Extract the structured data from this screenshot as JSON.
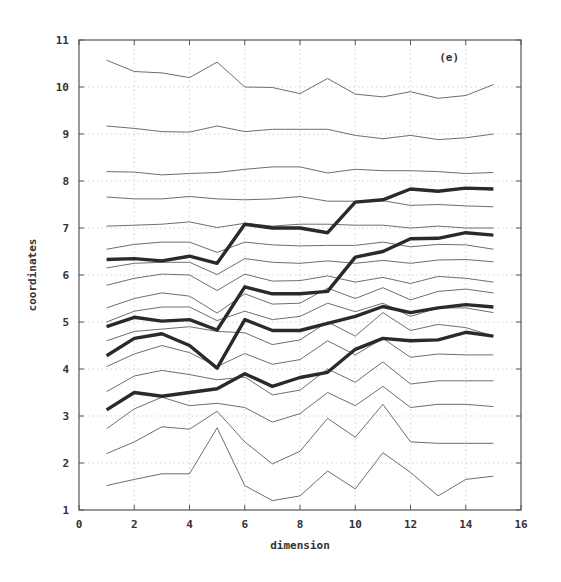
{
  "chart_data": {
    "type": "line",
    "title": "",
    "panel_label": "(e)",
    "xlabel": "dimension",
    "ylabel": "coordinates",
    "xlim": [
      0,
      16
    ],
    "ylim": [
      1,
      11
    ],
    "x_ticks": [
      0,
      2,
      4,
      6,
      8,
      10,
      12,
      14,
      16
    ],
    "y_ticks": [
      1,
      2,
      3,
      4,
      5,
      6,
      7,
      8,
      9,
      10,
      11
    ],
    "grid": true,
    "legend": null,
    "x": [
      1,
      2,
      3,
      4,
      5,
      6,
      7,
      8,
      9,
      10,
      11,
      12,
      13,
      14,
      15
    ],
    "series": [
      {
        "name": "thin-1",
        "style": "thin",
        "values": [
          10.57,
          10.33,
          10.3,
          10.2,
          10.53,
          10.0,
          9.99,
          9.86,
          10.18,
          9.85,
          9.79,
          9.9,
          9.76,
          9.82,
          10.05
        ]
      },
      {
        "name": "thin-2",
        "style": "thin",
        "values": [
          9.17,
          9.12,
          9.05,
          9.04,
          9.17,
          9.05,
          9.1,
          9.1,
          9.1,
          8.97,
          8.9,
          8.97,
          8.88,
          8.92,
          9.0
        ]
      },
      {
        "name": "thin-3",
        "style": "thin",
        "values": [
          8.2,
          8.19,
          8.13,
          8.16,
          8.18,
          8.25,
          8.3,
          8.3,
          8.17,
          8.25,
          8.22,
          8.22,
          8.2,
          8.16,
          8.18
        ]
      },
      {
        "name": "thin-4",
        "style": "thin",
        "values": [
          7.66,
          7.62,
          7.62,
          7.67,
          7.62,
          7.6,
          7.62,
          7.67,
          7.57,
          7.57,
          7.58,
          7.48,
          7.5,
          7.47,
          7.45
        ]
      },
      {
        "name": "thin-5",
        "style": "thin",
        "values": [
          7.04,
          7.06,
          7.08,
          7.13,
          7.01,
          7.1,
          7.04,
          7.08,
          7.08,
          7.06,
          7.06,
          7.0,
          7.04,
          7.0,
          7.0
        ]
      },
      {
        "name": "thin-6",
        "style": "thin",
        "values": [
          6.55,
          6.65,
          6.7,
          6.7,
          6.48,
          6.7,
          6.64,
          6.62,
          6.63,
          6.63,
          6.7,
          6.6,
          6.65,
          6.64,
          6.55
        ]
      },
      {
        "name": "thin-7",
        "style": "thin",
        "values": [
          6.15,
          6.25,
          6.27,
          6.27,
          6.01,
          6.35,
          6.27,
          6.25,
          6.3,
          6.25,
          6.31,
          6.25,
          6.32,
          6.33,
          6.28
        ]
      },
      {
        "name": "thin-8",
        "style": "thin",
        "values": [
          5.78,
          5.93,
          6.02,
          6.0,
          5.67,
          6.02,
          5.87,
          5.88,
          5.98,
          5.85,
          5.95,
          5.82,
          5.97,
          5.93,
          5.85
        ]
      },
      {
        "name": "thin-9",
        "style": "thin",
        "values": [
          5.3,
          5.5,
          5.62,
          5.55,
          5.19,
          5.6,
          5.38,
          5.4,
          5.72,
          5.5,
          5.73,
          5.47,
          5.65,
          5.7,
          5.62
        ]
      },
      {
        "name": "thin-10",
        "style": "thin",
        "values": [
          5.0,
          5.23,
          5.32,
          5.32,
          5.03,
          5.23,
          5.05,
          5.12,
          5.4,
          5.22,
          5.4,
          5.12,
          5.3,
          5.3,
          5.2
        ]
      },
      {
        "name": "thin-11",
        "style": "thin",
        "values": [
          4.6,
          4.8,
          4.85,
          4.9,
          4.8,
          4.77,
          4.52,
          4.62,
          5.0,
          4.7,
          5.2,
          4.82,
          4.95,
          4.88,
          4.7
        ]
      },
      {
        "name": "thin-12",
        "style": "thin",
        "values": [
          4.05,
          4.32,
          4.5,
          4.35,
          4.05,
          4.33,
          4.1,
          4.2,
          4.6,
          4.3,
          4.65,
          4.25,
          4.32,
          4.3,
          4.3
        ]
      },
      {
        "name": "thin-13",
        "style": "thin",
        "values": [
          3.52,
          3.85,
          3.97,
          3.88,
          3.77,
          3.83,
          3.45,
          3.55,
          4.0,
          3.72,
          4.15,
          3.68,
          3.75,
          3.75,
          3.75
        ]
      },
      {
        "name": "thin-14",
        "style": "thin",
        "values": [
          2.73,
          3.15,
          3.4,
          3.22,
          3.27,
          3.18,
          2.87,
          3.05,
          3.5,
          3.22,
          3.63,
          3.18,
          3.25,
          3.25,
          3.2
        ]
      },
      {
        "name": "thin-15",
        "style": "thin",
        "values": [
          2.2,
          2.45,
          2.77,
          2.72,
          3.1,
          2.45,
          1.98,
          2.25,
          2.95,
          2.55,
          3.25,
          2.45,
          2.42,
          2.42,
          2.42
        ]
      },
      {
        "name": "thin-16",
        "style": "thin",
        "values": [
          1.52,
          1.65,
          1.77,
          1.77,
          2.75,
          1.52,
          1.2,
          1.3,
          1.83,
          1.45,
          2.22,
          1.8,
          1.3,
          1.65,
          1.72
        ]
      },
      {
        "name": "thick-1",
        "style": "thick",
        "values": [
          6.33,
          6.35,
          6.3,
          6.4,
          6.25,
          7.08,
          7.0,
          7.0,
          6.9,
          7.55,
          7.6,
          7.83,
          7.78,
          7.85,
          7.83
        ]
      },
      {
        "name": "thick-2",
        "style": "thick",
        "values": [
          4.9,
          5.1,
          5.02,
          5.05,
          4.83,
          5.75,
          5.6,
          5.6,
          5.65,
          6.38,
          6.5,
          6.77,
          6.78,
          6.9,
          6.85
        ]
      },
      {
        "name": "thick-3",
        "style": "thick",
        "values": [
          4.28,
          4.65,
          4.75,
          4.5,
          4.02,
          5.05,
          4.82,
          4.82,
          4.97,
          5.12,
          5.33,
          5.2,
          5.3,
          5.37,
          5.32
        ]
      },
      {
        "name": "thick-4",
        "style": "thick",
        "values": [
          3.13,
          3.5,
          3.42,
          3.5,
          3.58,
          3.9,
          3.63,
          3.82,
          3.93,
          4.42,
          4.65,
          4.6,
          4.62,
          4.78,
          4.7
        ]
      }
    ]
  },
  "layout": {
    "plot_left": 79,
    "plot_right": 521,
    "plot_top": 40,
    "plot_bottom": 510
  }
}
